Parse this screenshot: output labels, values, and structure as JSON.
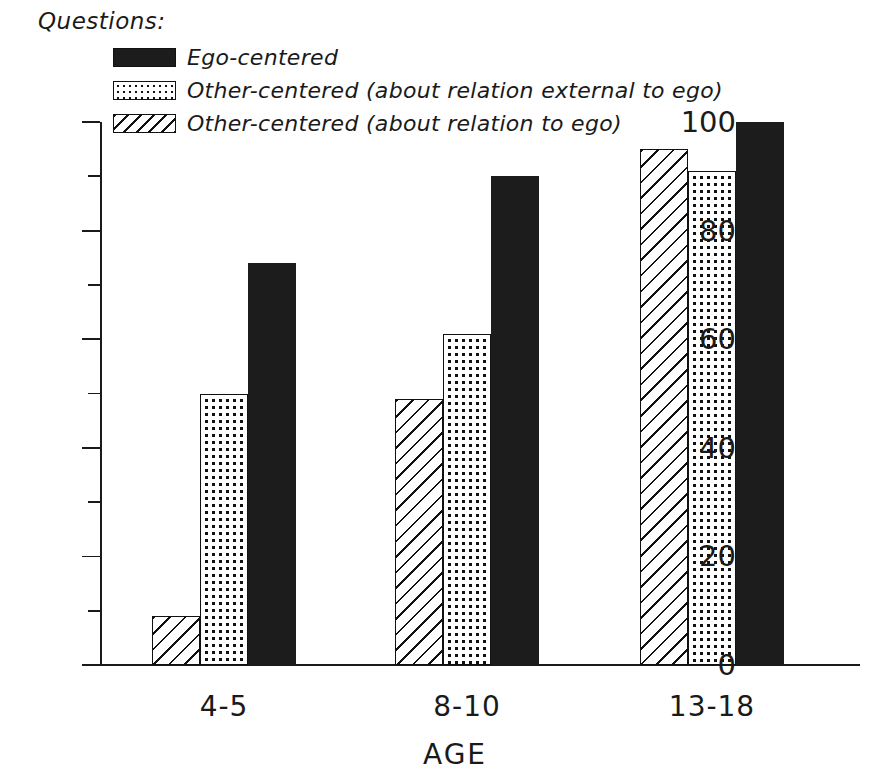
{
  "legend": {
    "title": "Questions:",
    "items": [
      {
        "label": "Ego-centered",
        "pattern": "solid-black"
      },
      {
        "label": "Other-centered (about relation external to ego)",
        "pattern": "dotted"
      },
      {
        "label": "Other-centered (about relation to ego)",
        "pattern": "diagonal-hatch"
      }
    ]
  },
  "axes": {
    "y_ticks": [
      "0",
      "20",
      "40",
      "60",
      "80",
      "100"
    ],
    "x_title": "AGE"
  },
  "chart_data": {
    "type": "bar",
    "title": "Questions:",
    "xlabel": "AGE",
    "ylabel": "",
    "ylim": [
      0,
      100
    ],
    "ytick_values": [
      0,
      20,
      40,
      60,
      80,
      100
    ],
    "yminor_tick_values": [
      10,
      30,
      50,
      70,
      90
    ],
    "grid": false,
    "legend_position": "top-left",
    "categories": [
      "4-5",
      "8-10",
      "13-18"
    ],
    "series": [
      {
        "name": "Other-centered (about relation to ego)",
        "pattern": "diagonal-hatch",
        "values": [
          9,
          49,
          95
        ]
      },
      {
        "name": "Other-centered (about relation external to ego)",
        "pattern": "dotted",
        "values": [
          50,
          61,
          91
        ]
      },
      {
        "name": "Ego-centered",
        "pattern": "solid-black",
        "values": [
          74,
          90,
          100
        ]
      }
    ]
  }
}
